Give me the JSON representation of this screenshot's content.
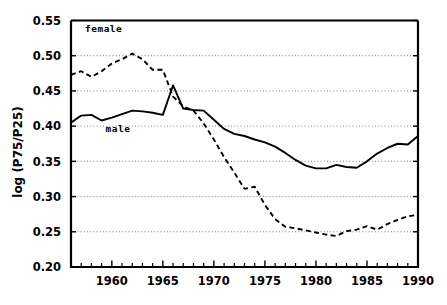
{
  "chart_data": {
    "type": "line",
    "title": "",
    "xlabel": "",
    "ylabel": "log (P75/P25)",
    "xlim": [
      1956,
      1990
    ],
    "ylim": [
      0.2,
      0.55
    ],
    "grid": true,
    "legend_position": "inline-annotations",
    "y_ticks": [
      "0.55",
      "0.50",
      "0.45",
      "0.40",
      "0.35",
      "0.30",
      "0.25",
      "0.20"
    ],
    "y_tick_values": [
      0.55,
      0.5,
      0.45,
      0.4,
      0.35,
      0.3,
      0.25,
      0.2
    ],
    "x_ticks": [
      "1960",
      "1965",
      "1970",
      "1975",
      "1980",
      "1985",
      "1990"
    ],
    "x_tick_values": [
      1960,
      1965,
      1970,
      1975,
      1980,
      1985,
      1990
    ],
    "x_minor_step": 1,
    "annotations": [
      {
        "label": "female",
        "x": 1959.2,
        "y": 0.533
      },
      {
        "label": "male",
        "x": 1960.6,
        "y": 0.392
      }
    ],
    "x": [
      1956,
      1957,
      1958,
      1959,
      1960,
      1961,
      1962,
      1963,
      1964,
      1965,
      1966,
      1967,
      1968,
      1969,
      1970,
      1971,
      1972,
      1973,
      1974,
      1975,
      1976,
      1977,
      1978,
      1979,
      1980,
      1981,
      1982,
      1983,
      1984,
      1985,
      1986,
      1987,
      1988,
      1989,
      1990
    ],
    "series": [
      {
        "name": "female",
        "style": "dashed",
        "color": "#000000",
        "values": [
          0.473,
          0.478,
          0.47,
          0.478,
          0.489,
          0.495,
          0.503,
          0.495,
          0.48,
          0.48,
          0.442,
          0.428,
          0.422,
          0.404,
          0.381,
          0.356,
          0.334,
          0.311,
          0.314,
          0.288,
          0.268,
          0.257,
          0.255,
          0.252,
          0.249,
          0.246,
          0.244,
          0.251,
          0.253,
          0.258,
          0.253,
          0.261,
          0.267,
          0.272,
          0.274
        ]
      },
      {
        "name": "male",
        "style": "solid",
        "color": "#000000",
        "values": [
          0.405,
          0.415,
          0.416,
          0.408,
          0.412,
          0.417,
          0.422,
          0.421,
          0.419,
          0.416,
          0.458,
          0.425,
          0.423,
          0.422,
          0.409,
          0.396,
          0.389,
          0.386,
          0.381,
          0.377,
          0.371,
          0.362,
          0.352,
          0.344,
          0.34,
          0.34,
          0.345,
          0.342,
          0.341,
          0.35,
          0.361,
          0.369,
          0.375,
          0.374,
          0.386
        ]
      }
    ]
  }
}
